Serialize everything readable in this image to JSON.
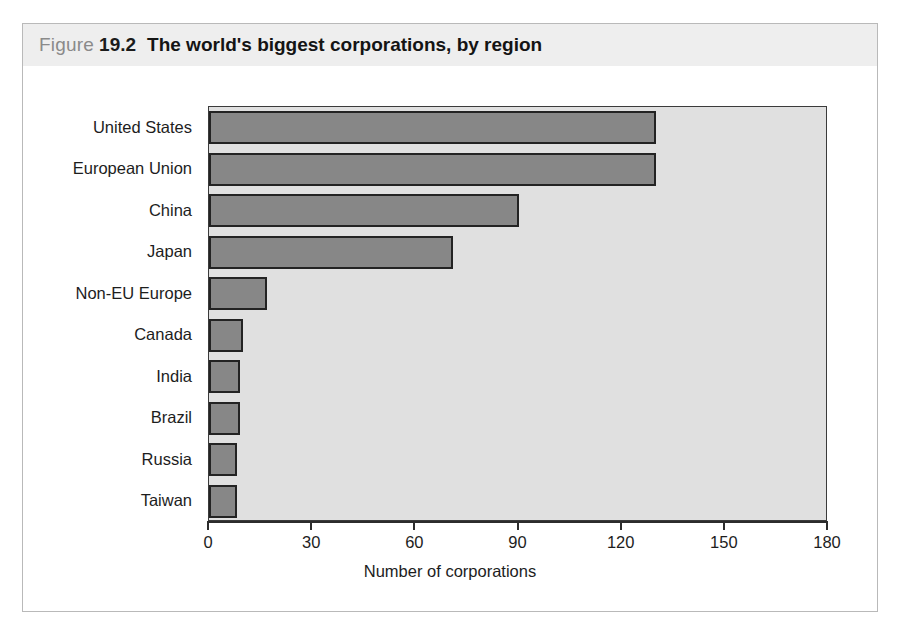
{
  "figure": {
    "label_word": "Figure",
    "number": "19.2",
    "title": "The world's biggest corporations, by region"
  },
  "colors": {
    "band_background": "#eeeeee",
    "plot_background": "#e0e0e0",
    "bar_fill": "#878787",
    "bar_border": "#232323",
    "axis": "#2c2c2c",
    "text": "#1d1d1d",
    "figure_word": "#8a8a8a",
    "frame_border": "#b9b9b9"
  },
  "chart_data": {
    "type": "bar",
    "orientation": "horizontal",
    "title": "The world's biggest corporations, by region",
    "xlabel": "Number of corporations",
    "ylabel": "",
    "xlim": [
      0,
      180
    ],
    "xticks": [
      0,
      30,
      60,
      90,
      120,
      150,
      180
    ],
    "xticklabels": [
      "0",
      "30",
      "60",
      "90",
      "120",
      "150",
      "180"
    ],
    "grid": false,
    "legend": null,
    "categories": [
      "United States",
      "European Union",
      "China",
      "Japan",
      "Non-EU Europe",
      "Canada",
      "India",
      "Brazil",
      "Russia",
      "Taiwan"
    ],
    "values": [
      130,
      130,
      90,
      71,
      17,
      10,
      9,
      9,
      8,
      8
    ]
  }
}
